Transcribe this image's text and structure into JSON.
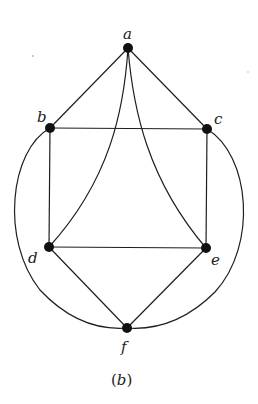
{
  "figure": {
    "caption_open": "(",
    "caption_letter": "b",
    "caption_close": ")",
    "colors": {
      "stroke": "#1e1e1e",
      "node": "#111111",
      "background": "#ffffff"
    }
  },
  "graph": {
    "nodes": [
      {
        "id": "a",
        "label": "a",
        "x": 128,
        "y": 48
      },
      {
        "id": "b",
        "label": "b",
        "x": 50,
        "y": 128
      },
      {
        "id": "c",
        "label": "c",
        "x": 207,
        "y": 129
      },
      {
        "id": "d",
        "label": "d",
        "x": 49,
        "y": 247
      },
      {
        "id": "e",
        "label": "e",
        "x": 206,
        "y": 248
      },
      {
        "id": "f",
        "label": "f",
        "x": 127,
        "y": 328
      }
    ],
    "edges": [
      {
        "from": "a",
        "to": "b",
        "shape": "straight"
      },
      {
        "from": "a",
        "to": "c",
        "shape": "straight"
      },
      {
        "from": "a",
        "to": "d",
        "shape": "curved"
      },
      {
        "from": "a",
        "to": "e",
        "shape": "curved"
      },
      {
        "from": "b",
        "to": "c",
        "shape": "straight"
      },
      {
        "from": "b",
        "to": "d",
        "shape": "straight"
      },
      {
        "from": "c",
        "to": "e",
        "shape": "straight"
      },
      {
        "from": "d",
        "to": "e",
        "shape": "straight"
      },
      {
        "from": "d",
        "to": "f",
        "shape": "straight"
      },
      {
        "from": "e",
        "to": "f",
        "shape": "straight"
      },
      {
        "from": "b",
        "to": "f",
        "shape": "outer-arc-left"
      },
      {
        "from": "c",
        "to": "f",
        "shape": "outer-arc-right"
      }
    ]
  }
}
